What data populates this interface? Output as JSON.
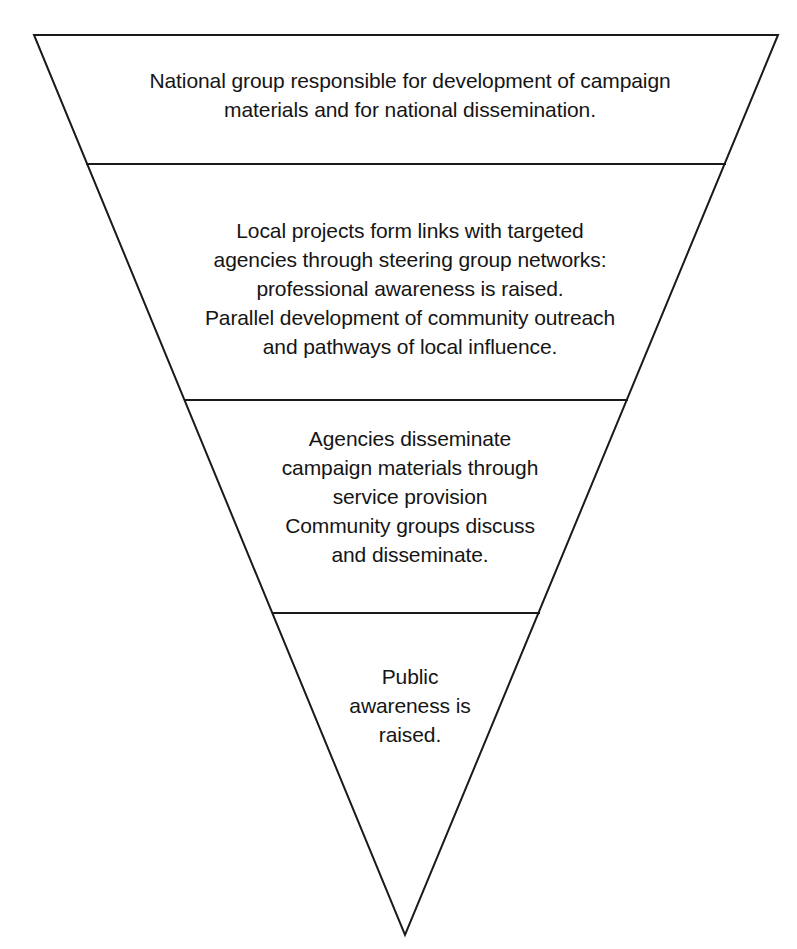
{
  "diagram": {
    "shape": "inverted-triangle",
    "stroke_color": "#1a1a1a",
    "fill_color": "#ffffff",
    "background_color": "#ffffff",
    "stroke_width": 2,
    "geometry": {
      "apex": {
        "x": 405,
        "y": 935
      },
      "top_left": {
        "x": 34,
        "y": 35
      },
      "top_right": {
        "x": 778,
        "y": 35
      },
      "divider_y": [
        164,
        400,
        613
      ]
    },
    "tiers": [
      {
        "index": 1,
        "name": "national-group",
        "text": "National group responsible for development of campaign\nmaterials and for national dissemination.",
        "lines": [
          "National group responsible for development of campaign",
          "materials and for national dissemination."
        ]
      },
      {
        "index": 2,
        "name": "local-projects",
        "text": "Local projects form links with targeted\nagencies through steering group networks:\nprofessional awareness is raised.\nParallel development of community outreach\nand pathways of local influence.",
        "lines": [
          "Local projects form links with targeted",
          "agencies through steering group networks:",
          "professional awareness is raised.",
          "Parallel development of community outreach",
          "and pathways of local influence."
        ]
      },
      {
        "index": 3,
        "name": "agencies-dissemination",
        "text": "Agencies disseminate\ncampaign materials through\nservice provision\nCommunity groups discuss\nand disseminate.",
        "lines": [
          "Agencies disseminate",
          "campaign materials through",
          "service provision",
          "Community groups discuss",
          "and disseminate."
        ]
      },
      {
        "index": 4,
        "name": "public-awareness",
        "text": "Public\nawareness is\nraised.",
        "lines": [
          "Public",
          "awareness is",
          "raised."
        ]
      }
    ]
  }
}
